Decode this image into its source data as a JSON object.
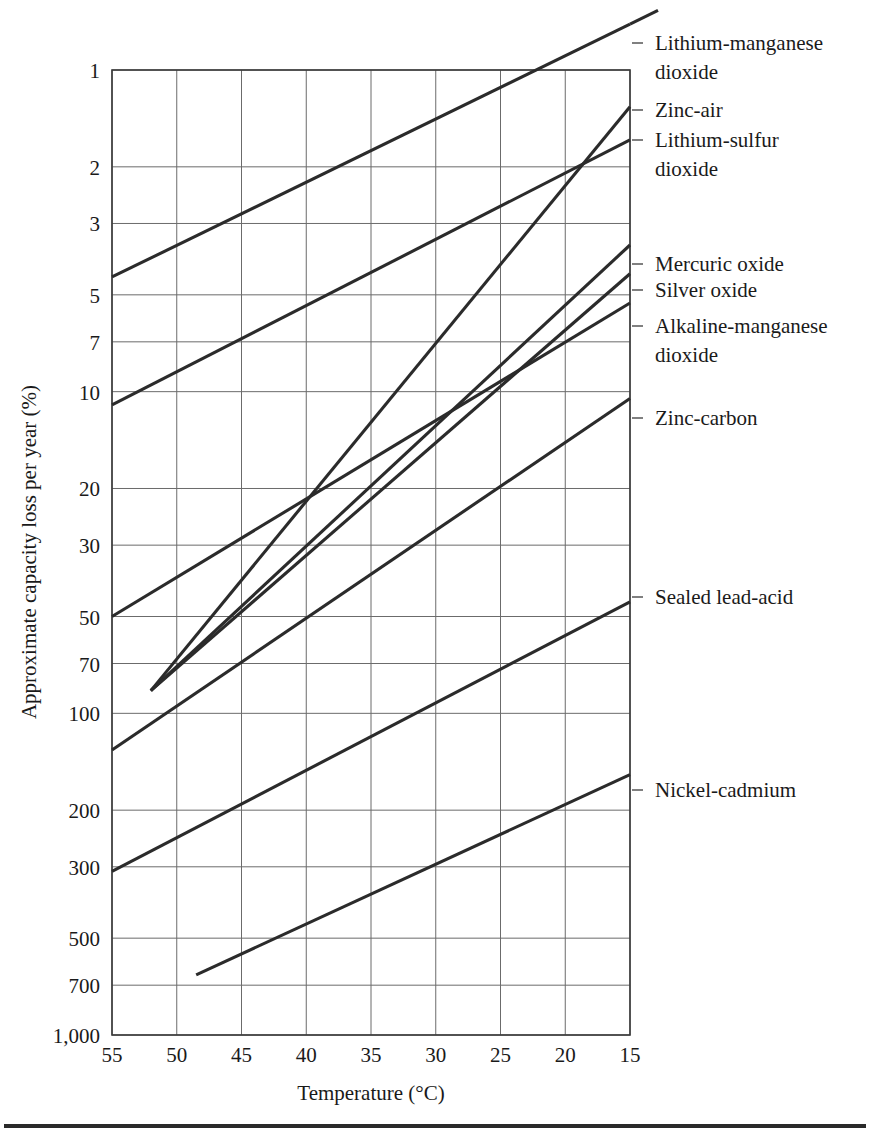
{
  "chart_data": {
    "type": "line",
    "title": "",
    "xlabel": "Temperature (°C)",
    "ylabel": "Approximate capacity loss per year (%)",
    "x_axis": {
      "tick_labels": [
        "55",
        "50",
        "45",
        "40",
        "35",
        "30",
        "25",
        "20",
        "15"
      ],
      "tick_values": [
        55,
        50,
        45,
        40,
        35,
        30,
        25,
        20,
        15
      ],
      "range": [
        55,
        15
      ],
      "direction": "descending",
      "scale": "linear"
    },
    "y_axis": {
      "tick_labels": [
        "1",
        "2",
        "3",
        "5",
        "7",
        "10",
        "20",
        "30",
        "50",
        "70",
        "100",
        "200",
        "300",
        "500",
        "700",
        "1,000"
      ],
      "tick_values": [
        1,
        2,
        3,
        5,
        7,
        10,
        20,
        30,
        50,
        70,
        100,
        200,
        300,
        500,
        700,
        1000
      ],
      "range": [
        1,
        1000
      ],
      "direction": "descending",
      "scale": "log10"
    },
    "grid": true,
    "legend_position": "right-inline-labels",
    "line_color": "#2b2b2b",
    "grid_color": "#6b6b6b",
    "series": [
      {
        "name": "Lithium-manganese dioxide",
        "label": "Lithium-manganese dioxide",
        "label_lines": [
          "Lithium-manganese",
          "dioxide"
        ],
        "points": [
          [
            55,
            4.4
          ],
          [
            15,
            0.72
          ]
        ]
      },
      {
        "name": "Zinc-air",
        "label": "Zinc-air",
        "label_lines": [
          "Zinc-air"
        ],
        "points": [
          [
            52,
            85
          ],
          [
            15,
            1.3
          ]
        ]
      },
      {
        "name": "Lithium-sulfur dioxide",
        "label": "Lithium-sulfur dioxide",
        "label_lines": [
          "Lithium-sulfur",
          "dioxide"
        ],
        "points": [
          [
            55,
            11
          ],
          [
            15,
            1.65
          ]
        ]
      },
      {
        "name": "Mercuric oxide",
        "label": "Mercuric oxide",
        "label_lines": [
          "Mercuric oxide"
        ],
        "points": [
          [
            52,
            85
          ],
          [
            15,
            3.5
          ]
        ]
      },
      {
        "name": "Silver oxide",
        "label": "Silver oxide",
        "label_lines": [
          "Silver oxide"
        ],
        "points": [
          [
            52,
            85
          ],
          [
            15,
            4.3
          ]
        ]
      },
      {
        "name": "Alkaline-manganese dioxide",
        "label": "Alkaline-manganese dioxide",
        "label_lines": [
          "Alkaline-manganese",
          "dioxide"
        ],
        "points": [
          [
            55,
            50
          ],
          [
            15,
            5.3
          ]
        ]
      },
      {
        "name": "Zinc-carbon",
        "label": "Zinc-carbon",
        "label_lines": [
          "Zinc-carbon"
        ],
        "points": [
          [
            55,
            130
          ],
          [
            15,
            10.5
          ]
        ]
      },
      {
        "name": "Sealed lead-acid",
        "label": "Sealed lead-acid",
        "label_lines": [
          "Sealed lead-acid"
        ],
        "points": [
          [
            55,
            310
          ],
          [
            15,
            45
          ]
        ]
      },
      {
        "name": "Nickel-cadmium",
        "label": "Nickel-cadmium",
        "label_lines": [
          "Nickel-cadmium"
        ],
        "points": [
          [
            48.5,
            650
          ],
          [
            15,
            155
          ]
        ]
      }
    ],
    "callouts": [
      {
        "name": "Lithium-manganese dioxide",
        "leader_y": 43
      },
      {
        "name": "Zinc-air",
        "leader_y": 110
      },
      {
        "name": "Lithium-sulfur dioxide",
        "leader_y": 140
      },
      {
        "name": "Mercuric oxide",
        "leader_y": 264
      },
      {
        "name": "Silver oxide",
        "leader_y": 290
      },
      {
        "name": "Alkaline-manganese dioxide",
        "leader_y": 326
      },
      {
        "name": "Zinc-carbon",
        "leader_y": 418
      },
      {
        "name": "Sealed lead-acid",
        "leader_y": 597
      },
      {
        "name": "Nickel-cadmium",
        "leader_y": 790
      }
    ]
  }
}
